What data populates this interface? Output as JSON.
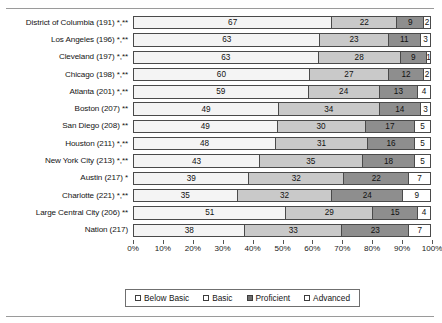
{
  "chart_data": {
    "type": "bar",
    "subtype": "stacked-horizontal-percent",
    "title": "",
    "xlabel": "",
    "ylabel": "",
    "xlim": [
      0,
      100
    ],
    "xticks": [
      "0%",
      "10%",
      "20%",
      "30%",
      "40%",
      "50%",
      "60%",
      "70%",
      "80%",
      "90%",
      "100%"
    ],
    "grid": false,
    "legend_position": "bottom",
    "legend": [
      "Below Basic",
      "Basic",
      "Proficient",
      "Advanced"
    ],
    "categories": [
      "District of Columbia (191) *,**",
      "Los Angeles (196) *,**",
      "Cleveland (197) *,**",
      "Chicago (198) *,**",
      "Atlanta (201) *,**",
      "Boston (207) **",
      "San Diego (208) **",
      "Houston (211) *,**",
      "New York City (213) *,**",
      "Austin (217) *",
      "Charlotte (221) *,**",
      "Large Central City (206) **",
      "Nation (217)"
    ],
    "series": [
      {
        "name": "Below Basic",
        "values": [
          67,
          63,
          63,
          60,
          59,
          49,
          49,
          48,
          43,
          39,
          35,
          51,
          38
        ]
      },
      {
        "name": "Basic",
        "values": [
          22,
          23,
          28,
          27,
          24,
          34,
          30,
          31,
          35,
          32,
          32,
          29,
          33
        ]
      },
      {
        "name": "Proficient",
        "values": [
          9,
          11,
          9,
          12,
          13,
          14,
          17,
          16,
          18,
          22,
          24,
          15,
          23
        ]
      },
      {
        "name": "Advanced",
        "values": [
          2,
          3,
          1,
          2,
          4,
          3,
          5,
          5,
          5,
          7,
          9,
          4,
          7
        ]
      }
    ]
  },
  "colors": {
    "below_basic": "#f4f4f4",
    "basic": "#c9c9c9",
    "proficient": "#8e8e8e",
    "advanced": "#ffffff",
    "outline": "#4a4a4a",
    "rule": "#9a9a9a"
  }
}
